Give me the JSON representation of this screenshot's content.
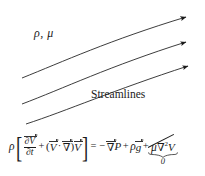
{
  "figure": {
    "background_color": "#ffffff",
    "line_color": "#1a1a1a",
    "text_color": "#1a1a1a"
  },
  "labels": {
    "fluid_properties": "ρ, μ",
    "streamlines": "Streamlines"
  },
  "streamlines": [
    {
      "name": "streamline-top",
      "start": [
        22,
        92
      ],
      "end": [
        188,
        13
      ],
      "arrowhead": true
    },
    {
      "name": "streamline-middle",
      "start": [
        22,
        122
      ],
      "end": [
        188,
        43
      ],
      "arrowhead": true
    },
    {
      "name": "streamline-bottom",
      "start": [
        25,
        152
      ],
      "end": [
        188,
        70
      ],
      "arrowhead": true
    }
  ],
  "equation": {
    "description": "Navier-Stokes momentum equation with viscous term cancelled",
    "rho_outside": "ρ",
    "bracket_open": "[",
    "bracket_close": "]",
    "partial_numerator": "∂V",
    "partial_denominator": "∂t",
    "plus_1": "+",
    "paren_open": "(",
    "convective_V": "V",
    "dot": "·",
    "nabla_conv": "∇",
    "paren_close": ")",
    "convective_V2": "V",
    "equals": "=",
    "minus": "−",
    "nabla_P": "∇",
    "pressure": "P",
    "plus_2": "+",
    "rho_gravity": "ρ",
    "gravity": "g",
    "plus_3": "+",
    "mu": "μ",
    "nabla_visc": "∇",
    "laplacian_exponent": "2",
    "viscous_V": "V",
    "cancelled_value": "0",
    "cancelled": true
  }
}
